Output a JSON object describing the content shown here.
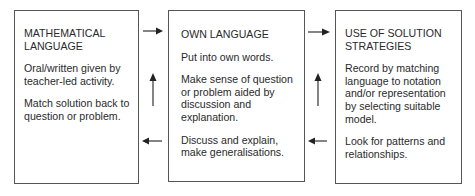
{
  "diagram": {
    "boxes": [
      {
        "id": "mathematical-language",
        "title": "MATHEMATICAL LANGUAGE",
        "title_lines": [
          "MATHEMATICAL",
          "LANGUAGE"
        ],
        "paragraphs": [
          "Oral/written given by teacher-led activity.",
          "Match solution back to question or problem."
        ]
      },
      {
        "id": "own-language",
        "title": "OWN LANGUAGE",
        "title_lines": [
          "OWN LANGUAGE"
        ],
        "paragraphs": [
          "Put into own words.",
          "Make sense of question or problem aided by discussion and explanation.",
          "Discuss and explain, make generalisations."
        ]
      },
      {
        "id": "use-of-solution-strategies",
        "title": "USE OF SOLUTION STRATEGIES",
        "title_lines": [
          "USE OF SOLUTION",
          "STRATEGIES"
        ],
        "paragraphs": [
          "Record by matching language to notation and/or representation by selecting suitable model.",
          "Look for patterns and relationships."
        ]
      }
    ],
    "arrows": [
      {
        "from": "mathematical-language",
        "to": "own-language",
        "direction": "right"
      },
      {
        "from": "own-language",
        "to": "use-of-solution-strategies",
        "direction": "right"
      },
      {
        "from": "own-language",
        "to": "mathematical-language",
        "direction": "left"
      },
      {
        "from": "use-of-solution-strategies",
        "to": "own-language",
        "direction": "left"
      },
      {
        "between": [
          "mathematical-language",
          "own-language"
        ],
        "direction": "up"
      },
      {
        "between": [
          "own-language",
          "use-of-solution-strategies"
        ],
        "direction": "up"
      }
    ],
    "colors": {
      "line": "#555555",
      "arrow": "#222222",
      "text": "#2a2a2a",
      "background": "#ffffff"
    }
  }
}
